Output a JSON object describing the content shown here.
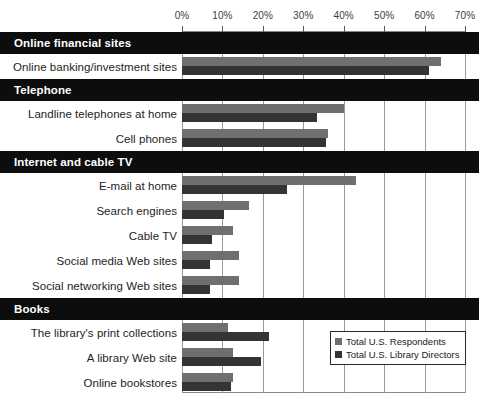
{
  "chart_data": {
    "type": "bar",
    "orientation": "horizontal",
    "title": "",
    "xlabel": "",
    "ylabel": "",
    "xlim": [
      0,
      70
    ],
    "xticks": [
      "0%",
      "10%",
      "20%",
      "30%",
      "40%",
      "50%",
      "60%",
      "70%"
    ],
    "xtick_values": [
      0,
      10,
      20,
      30,
      40,
      50,
      60,
      70
    ],
    "grid": true,
    "legend_position": "bottom-right",
    "series": [
      {
        "name": "Total U.S. Respondents",
        "color": "#6f6f6f"
      },
      {
        "name": "Total U.S. Library Directors",
        "color": "#343434"
      }
    ],
    "groups": [
      {
        "header": "Online financial sites",
        "rows": [
          {
            "label": "Online banking/investment sites",
            "values": [
              64,
              61
            ]
          }
        ]
      },
      {
        "header": "Telephone",
        "rows": [
          {
            "label": "Landline telephones at home",
            "values": [
              40,
              33.5
            ]
          },
          {
            "label": "Cell phones",
            "values": [
              36,
              35.5
            ]
          }
        ]
      },
      {
        "header": "Internet and cable TV",
        "rows": [
          {
            "label": "E-mail at home",
            "values": [
              43,
              26
            ]
          },
          {
            "label": "Search engines",
            "values": [
              16.5,
              10.5
            ]
          },
          {
            "label": "Cable TV",
            "values": [
              12.5,
              7.5
            ]
          },
          {
            "label": "Social media Web sites",
            "values": [
              14,
              7
            ]
          },
          {
            "label": "Social networking Web sites",
            "values": [
              14,
              7
            ]
          }
        ]
      },
      {
        "header": "Books",
        "rows": [
          {
            "label": "The library's print collections",
            "values": [
              11.5,
              21.5
            ]
          },
          {
            "label": "A library Web site",
            "values": [
              12.5,
              19.5
            ]
          },
          {
            "label": "Online bookstores",
            "values": [
              12.5,
              12
            ]
          }
        ]
      }
    ]
  },
  "legend": {
    "items": [
      {
        "label": "Total U.S. Respondents",
        "swatch": "light"
      },
      {
        "label": "Total U.S. Library Directors",
        "swatch": "dark"
      }
    ]
  }
}
